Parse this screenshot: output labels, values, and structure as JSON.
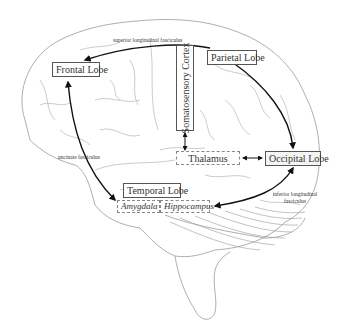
{
  "diagram": {
    "type": "brain-anatomy-schematic",
    "regions": {
      "frontal_lobe": "Frontal Lobe",
      "parietal_lobe": "Parietal Lobe",
      "somatosensory_cortex": "Somatosensory Cortex",
      "thalamus": "Thalamus",
      "occipital_lobe": "Occipital Lobe",
      "temporal_lobe": "Temporal Lobe",
      "amygdala": "Amygdala",
      "hippocampus": "Hippocampus"
    },
    "tracts": {
      "superior_longitudinal": "superior longitudinal fasciculus",
      "uncinate": "uncinate fasciculus",
      "inferior_longitudinal_line1": "inferior longitudinal",
      "inferior_longitudinal_line2": "fasciculus"
    },
    "connections": [
      {
        "from": "Parietal Lobe",
        "to": "Frontal Lobe",
        "via": "superior longitudinal fasciculus",
        "direction": "one-way"
      },
      {
        "from": "Frontal Lobe",
        "to": "Amygdala",
        "via": "uncinate fasciculus",
        "direction": "two-way"
      },
      {
        "from": "Parietal Lobe",
        "to": "Occipital Lobe",
        "direction": "one-way"
      },
      {
        "from": "Somatosensory Cortex",
        "to": "Thalamus",
        "direction": "two-way"
      },
      {
        "from": "Thalamus",
        "to": "Occipital Lobe",
        "direction": "two-way"
      },
      {
        "from": "Occipital Lobe",
        "to": "Hippocampus",
        "via": "inferior longitudinal fasciculus",
        "direction": "two-way"
      }
    ],
    "colors": {
      "outline": "#999999",
      "arrow": "#111111",
      "box_border": "#555555",
      "text": "#333333"
    }
  }
}
